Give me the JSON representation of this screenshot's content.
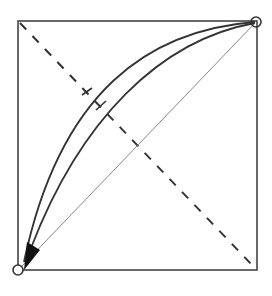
{
  "diagram": {
    "type": "geometric-paths",
    "square": {
      "x": 18,
      "y": 21,
      "width": 239,
      "height": 249
    },
    "start_point": {
      "x": 256,
      "y": 21,
      "marker": "circle"
    },
    "end_point": {
      "x": 18,
      "y": 270,
      "marker": "circle"
    },
    "straight_path": {
      "style": "thin-gray",
      "from": "bottom-left",
      "to": "top-right"
    },
    "anti_diagonal": {
      "style": "dashed",
      "from": "top-left",
      "to": "bottom-right"
    },
    "curves": [
      {
        "name": "outer-curve",
        "from": "top-right",
        "to": "bottom-left"
      },
      {
        "name": "inner-curve",
        "from": "top-right",
        "to": "bottom-left",
        "arrowhead": "bottom-left"
      }
    ],
    "colors": {
      "stroke": "#333333",
      "gray": "#888888",
      "background": "#ffffff"
    }
  }
}
